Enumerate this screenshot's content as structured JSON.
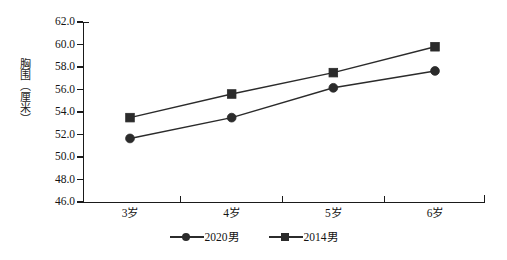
{
  "chart_data": {
    "type": "line",
    "title": "",
    "subtitle": "",
    "xlabel": "",
    "ylabel": "胸围（厘米）",
    "categories": [
      "3岁",
      "4岁",
      "5岁",
      "6岁"
    ],
    "ylim": [
      46.0,
      62.0
    ],
    "ytick_step": 2.0,
    "ytick_labels": [
      "62.0",
      "60.0",
      "58.0",
      "56.0",
      "54.0",
      "52.0",
      "50.0",
      "48.0",
      "46.0"
    ],
    "ytick_values": [
      62.0,
      60.0,
      58.0,
      56.0,
      54.0,
      52.0,
      50.0,
      48.0,
      46.0
    ],
    "grid": false,
    "legend_position": "bottom-center",
    "series": [
      {
        "name": "2020男",
        "marker": "circle",
        "color": "#2b2b2b",
        "values": [
          51.65,
          53.5,
          56.15,
          57.65
        ]
      },
      {
        "name": "2014男",
        "marker": "square",
        "color": "#2b2b2b",
        "values": [
          53.5,
          55.6,
          57.5,
          59.8
        ]
      }
    ]
  },
  "axis": {
    "y_title_chars": [
      "胸",
      "围",
      "（",
      "厘",
      "米",
      "）"
    ]
  },
  "legend": {
    "items": [
      {
        "label": "2020男",
        "marker": "circle-marker"
      },
      {
        "label": "2014男",
        "marker": "square-marker"
      }
    ]
  }
}
